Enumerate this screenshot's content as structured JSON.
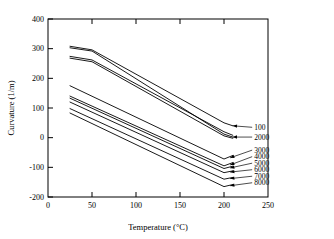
{
  "chart_data": {
    "type": "line",
    "title": "",
    "xlabel": "Temperature (°C)",
    "ylabel": "Curvature  (1/m)",
    "xlim": [
      0,
      250
    ],
    "ylim": [
      -200,
      400
    ],
    "xticks": [
      0,
      50,
      100,
      150,
      200,
      250
    ],
    "yticks": [
      -200,
      -100,
      0,
      100,
      200,
      300,
      400
    ],
    "xtick_labels": [
      "0",
      "50",
      "100",
      "150",
      "200",
      "250"
    ],
    "ytick_labels": [
      "-200",
      "-100",
      "0",
      "100",
      "200",
      "300",
      "400"
    ],
    "grid": false,
    "legend": "right-inline-labels",
    "series": [
      {
        "name": "100",
        "label": "100",
        "x": [
          25,
          50,
          200,
          210
        ],
        "values": [
          308,
          296,
          50,
          40
        ]
      },
      {
        "name": "2000",
        "label": "2000",
        "x": [
          25,
          50,
          200,
          210
        ],
        "values": [
          303,
          292,
          12,
          2
        ]
      },
      {
        "name": "3000-upper-pair-a",
        "label": "",
        "x": [
          25,
          50,
          200,
          210
        ],
        "values": [
          274,
          262,
          20,
          8
        ]
      },
      {
        "name": "3000-upper-pair-b",
        "label": "",
        "x": [
          25,
          50,
          200,
          210
        ],
        "values": [
          268,
          256,
          6,
          -2
        ]
      },
      {
        "name": "3000",
        "label": "3000",
        "x": [
          25,
          200,
          210
        ],
        "values": [
          175,
          -72,
          -60
        ]
      },
      {
        "name": "4000",
        "label": "4000",
        "x": [
          25,
          200,
          210
        ],
        "values": [
          140,
          -95,
          -84
        ]
      },
      {
        "name": "5000",
        "label": "5000",
        "x": [
          25,
          200,
          210
        ],
        "values": [
          133,
          -104,
          -96
        ]
      },
      {
        "name": "6000",
        "label": "6000",
        "x": [
          25,
          200,
          210
        ],
        "values": [
          120,
          -118,
          -112
        ]
      },
      {
        "name": "7000",
        "label": "7000",
        "x": [
          25,
          200,
          210
        ],
        "values": [
          98,
          -140,
          -134
        ]
      },
      {
        "name": "8000",
        "label": "8000",
        "x": [
          25,
          200,
          210
        ],
        "values": [
          83,
          -165,
          -158
        ]
      }
    ],
    "annotations": [
      {
        "text": "100",
        "series": "100",
        "anchor_x": 210,
        "anchor_y": 40,
        "label_x": 232,
        "label_y": 35
      },
      {
        "text": "2000",
        "series": "2000",
        "anchor_x": 210,
        "anchor_y": 2,
        "label_x": 232,
        "label_y": 2
      },
      {
        "text": "3000",
        "series": "3000",
        "anchor_x": 207,
        "anchor_y": -68,
        "label_x": 232,
        "label_y": -42
      },
      {
        "text": "4000",
        "series": "4000",
        "anchor_x": 207,
        "anchor_y": -92,
        "label_x": 232,
        "label_y": -64
      },
      {
        "text": "5000",
        "series": "5000",
        "anchor_x": 207,
        "anchor_y": -102,
        "label_x": 232,
        "label_y": -86
      },
      {
        "text": "6000",
        "series": "6000",
        "anchor_x": 207,
        "anchor_y": -116,
        "label_x": 232,
        "label_y": -108
      },
      {
        "text": "7000",
        "series": "7000",
        "anchor_x": 207,
        "anchor_y": -138,
        "label_x": 232,
        "label_y": -130
      },
      {
        "text": "8000",
        "series": "8000",
        "anchor_x": 207,
        "anchor_y": -162,
        "label_x": 232,
        "label_y": -152
      }
    ],
    "colors": {
      "line": "#000000",
      "axis": "#000000",
      "background": "#ffffff"
    }
  }
}
